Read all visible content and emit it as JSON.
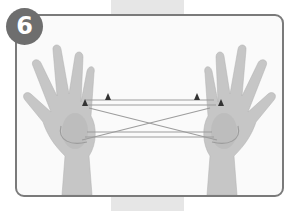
{
  "step": {
    "number": "6"
  },
  "illustration": {
    "subject": "two-hands-string-figure",
    "markers": [
      "triangle-marker",
      "triangle-marker",
      "triangle-marker",
      "triangle-marker"
    ],
    "colors": {
      "frame": "#7a7a7a",
      "badge": "#6e6e6e",
      "skin": "#c4c4c4",
      "string": "#9a9a9a",
      "marker": "#333333",
      "tape": "#e6e6e6"
    }
  }
}
